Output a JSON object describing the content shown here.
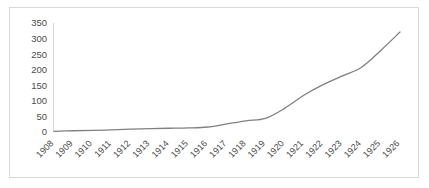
{
  "chart_data": {
    "type": "line",
    "title": "",
    "subtitle": "",
    "xlabel": "",
    "ylabel": "",
    "categories": [
      "1908",
      "1909",
      "1910",
      "1911",
      "1912",
      "1913",
      "1914",
      "1915",
      "1916",
      "1917",
      "1918",
      "1919",
      "1920",
      "1921",
      "1922",
      "1923",
      "1924",
      "1925",
      "1926"
    ],
    "values": [
      2,
      4,
      5,
      7,
      9,
      11,
      12,
      13,
      16,
      26,
      36,
      44,
      76,
      118,
      152,
      180,
      208,
      262,
      321
    ],
    "series": [
      {
        "name": "series-1",
        "color": "#808080",
        "values": [
          2,
          4,
          5,
          7,
          9,
          11,
          12,
          13,
          16,
          26,
          36,
          44,
          76,
          118,
          152,
          180,
          208,
          262,
          321
        ]
      }
    ],
    "yticks": [
      0,
      50,
      100,
      150,
      200,
      250,
      300,
      350
    ],
    "ylim": [
      0,
      350
    ],
    "xlim": [
      "1908",
      "1926"
    ],
    "grid": false,
    "legend": "none",
    "line_color": "#808080",
    "axis_color": "#c8c8c8",
    "text_color": "#4c4c4c",
    "border_color": "#d9d9d9",
    "background": "#ffffff"
  }
}
